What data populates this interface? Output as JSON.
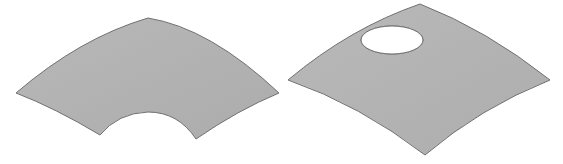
{
  "figure": {
    "background": "#ffffff",
    "surface_fill": "#b3b3b3",
    "surface_edge": "#6e6e6e",
    "hole_fill": "#ffffff",
    "shapes": [
      {
        "name": "annular-sector-surface",
        "description": "Curved surface patch shaped like an annular sector (concave cutout on bottom edge)"
      },
      {
        "name": "curved-quad-surface-with-hole",
        "description": "Curved quadrilateral surface patch with an elliptical hole near the top"
      }
    ]
  }
}
